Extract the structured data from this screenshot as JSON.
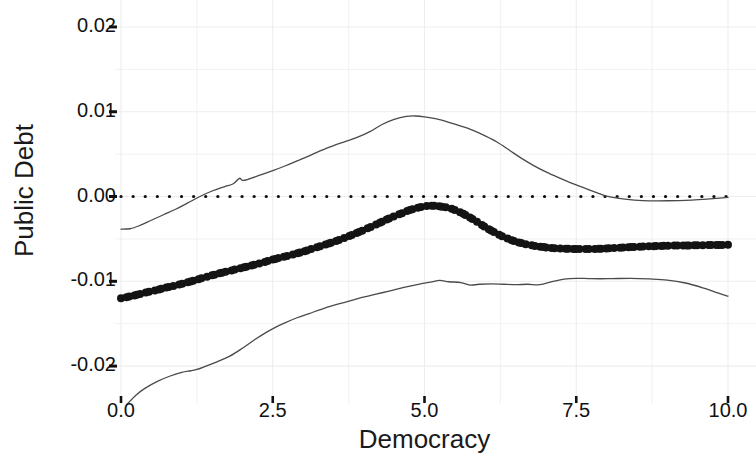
{
  "chart_data": {
    "type": "line",
    "title": "",
    "subtitle": "",
    "xlabel": "Democracy",
    "ylabel": "Public Debt",
    "xlim": [
      0.0,
      10.0
    ],
    "ylim": [
      -0.024,
      0.022
    ],
    "xticks": [
      "0.0",
      "2.5",
      "5.0",
      "7.5",
      "10.0"
    ],
    "xtick_values": [
      0.0,
      2.5,
      5.0,
      7.5,
      10.0
    ],
    "yticks": [
      "0.02",
      "0.01",
      "0.00",
      "-0.01",
      "-0.02"
    ],
    "ytick_values": [
      0.02,
      0.01,
      0.0,
      -0.01,
      -0.02
    ],
    "grid": true,
    "grid_color": "#ededed",
    "legend": "none",
    "reference_line": {
      "name": "zero-reference",
      "style": "dotted",
      "y": 0.0,
      "color": "#111111"
    },
    "series": [
      {
        "name": "Marginal effect estimate",
        "style": "line-with-points",
        "color": "#141414",
        "marker": "filled-circle",
        "x": [
          0.0,
          0.2,
          0.4,
          0.6,
          0.8,
          1.0,
          1.2,
          1.4,
          1.6,
          1.8,
          2.0,
          2.2,
          2.4,
          2.6,
          2.8,
          3.0,
          3.2,
          3.4,
          3.6,
          3.8,
          4.0,
          4.2,
          4.4,
          4.6,
          4.8,
          5.0,
          5.1,
          5.2,
          5.4,
          5.6,
          5.8,
          6.0,
          6.2,
          6.4,
          6.6,
          6.8,
          7.0,
          7.2,
          7.4,
          7.6,
          7.8,
          8.0,
          8.2,
          8.4,
          8.6,
          8.8,
          9.0,
          9.2,
          9.4,
          9.6,
          9.8,
          10.0
        ],
        "y": [
          -0.012,
          -0.0117,
          -0.01135,
          -0.011,
          -0.01065,
          -0.0103,
          -0.0099,
          -0.0095,
          -0.0091,
          -0.00875,
          -0.0084,
          -0.00805,
          -0.00765,
          -0.00725,
          -0.0069,
          -0.0065,
          -0.00605,
          -0.0056,
          -0.0051,
          -0.00455,
          -0.00395,
          -0.0033,
          -0.00265,
          -0.00205,
          -0.0015,
          -0.00115,
          -0.00108,
          -0.00112,
          -0.00135,
          -0.0019,
          -0.0027,
          -0.0036,
          -0.0044,
          -0.00505,
          -0.0055,
          -0.0058,
          -0.006,
          -0.00612,
          -0.00618,
          -0.0062,
          -0.00618,
          -0.00612,
          -0.00604,
          -0.00596,
          -0.0059,
          -0.00585,
          -0.0058,
          -0.00578,
          -0.00576,
          -0.00574,
          -0.00572,
          -0.0057
        ]
      },
      {
        "name": "Upper 95% confidence band",
        "style": "thin-line",
        "color": "#4a4a4a",
        "x": [
          0.0,
          0.15,
          0.3,
          0.5,
          0.7,
          0.9,
          1.1,
          1.3,
          1.5,
          1.7,
          1.85,
          1.95,
          2.0,
          2.1,
          2.3,
          2.5,
          2.7,
          2.9,
          3.1,
          3.3,
          3.5,
          3.7,
          3.9,
          4.1,
          4.3,
          4.5,
          4.7,
          4.85,
          5.0,
          5.2,
          5.4,
          5.6,
          5.8,
          6.0,
          6.2,
          6.4,
          6.6,
          6.8,
          7.0,
          7.2,
          7.4,
          7.6,
          7.8,
          8.0,
          8.3,
          8.6,
          9.0,
          9.4,
          9.7,
          10.0
        ],
        "y": [
          -0.00385,
          -0.0038,
          -0.00345,
          -0.0028,
          -0.00215,
          -0.0015,
          -0.00075,
          0.0,
          0.00065,
          0.00115,
          0.0015,
          0.00215,
          0.0019,
          0.00205,
          0.00255,
          0.00305,
          0.0036,
          0.0042,
          0.0048,
          0.00545,
          0.006,
          0.0065,
          0.007,
          0.00765,
          0.0085,
          0.0091,
          0.00945,
          0.0095,
          0.0094,
          0.00915,
          0.00875,
          0.0083,
          0.0078,
          0.00715,
          0.0064,
          0.00545,
          0.0045,
          0.00365,
          0.0029,
          0.00225,
          0.00165,
          0.0011,
          0.00055,
          5e-05,
          -0.0003,
          -0.00048,
          -0.0005,
          -0.00042,
          -0.00028,
          -0.0001
        ]
      },
      {
        "name": "Lower 95% confidence band",
        "style": "thin-line",
        "color": "#4a4a4a",
        "x": [
          0.1,
          0.25,
          0.4,
          0.6,
          0.8,
          1.0,
          1.15,
          1.25,
          1.4,
          1.6,
          1.8,
          2.0,
          2.2,
          2.4,
          2.55,
          2.7,
          2.9,
          3.1,
          3.3,
          3.5,
          3.7,
          3.9,
          4.1,
          4.3,
          4.5,
          4.7,
          4.9,
          5.1,
          5.25,
          5.4,
          5.6,
          5.75,
          5.9,
          6.1,
          6.3,
          6.5,
          6.7,
          6.9,
          7.1,
          7.3,
          7.5,
          7.7,
          7.9,
          8.1,
          8.4,
          8.7,
          9.0,
          9.3,
          9.6,
          9.8,
          10.0
        ],
        "y": [
          -0.0245,
          -0.0234,
          -0.0226,
          -0.0218,
          -0.0212,
          -0.02075,
          -0.02055,
          -0.0204,
          -0.02,
          -0.01945,
          -0.0188,
          -0.0179,
          -0.0169,
          -0.016,
          -0.0154,
          -0.0149,
          -0.0143,
          -0.0138,
          -0.0133,
          -0.01285,
          -0.01245,
          -0.01205,
          -0.0117,
          -0.01135,
          -0.011,
          -0.01065,
          -0.01035,
          -0.0101,
          -0.0099,
          -0.01005,
          -0.01015,
          -0.01045,
          -0.01035,
          -0.0103,
          -0.01035,
          -0.0104,
          -0.01035,
          -0.0104,
          -0.01005,
          -0.00975,
          -0.00965,
          -0.00968,
          -0.0097,
          -0.00968,
          -0.00965,
          -0.00972,
          -0.00985,
          -0.0102,
          -0.0108,
          -0.0113,
          -0.01175
        ]
      }
    ]
  }
}
